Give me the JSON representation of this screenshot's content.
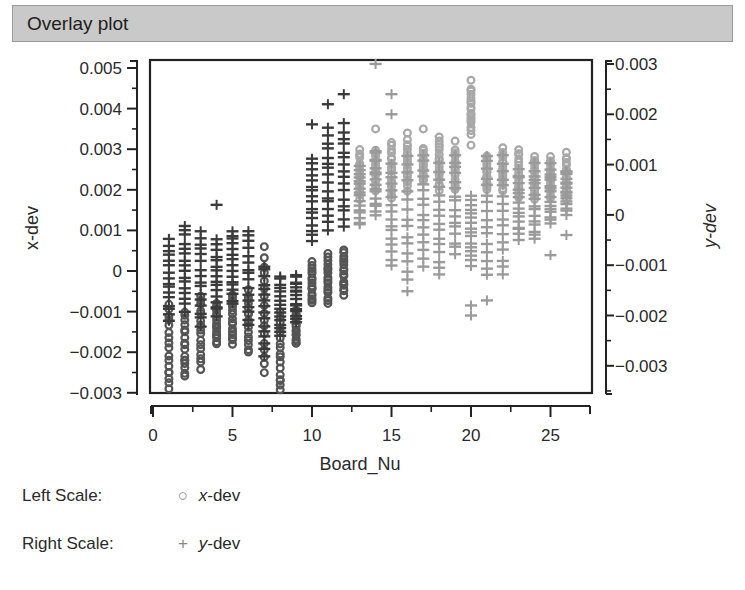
{
  "panel": {
    "title": "Overlay plot"
  },
  "legend": {
    "left": {
      "label": "Left Scale:",
      "symbol": "○",
      "series_prefix": "x",
      "series_suffix": "-dev"
    },
    "right": {
      "label": "Right Scale:",
      "symbol": "+",
      "series_prefix": "y",
      "series_suffix": "-dev"
    }
  },
  "colors": {
    "xdev_dark": "#555555",
    "xdev_light": "#a8a8a8",
    "ydev_dark": "#3a3a3a",
    "ydev_light": "#9a9a9a",
    "frame": "#222222"
  },
  "chart_data": {
    "type": "scatter",
    "title": "Overlay plot",
    "xlabel": "Board_Nu",
    "ylabel_left": "x-dev",
    "ylabel_right": "y-dev",
    "xlim": [
      0,
      27.5
    ],
    "ylim_left": [
      -0.003,
      0.005
    ],
    "ylim_right": [
      -0.0032,
      0.003
    ],
    "x_ticks": [
      0,
      5,
      10,
      15,
      20,
      25
    ],
    "y_ticks_left": [
      "0.005",
      "0.004",
      "0.003",
      "0.002",
      "0.001",
      "0",
      "−0.001",
      "−0.002",
      "−0.003"
    ],
    "y_tick_values_left": [
      0.005,
      0.004,
      0.003,
      0.002,
      0.001,
      0,
      -0.001,
      -0.002,
      -0.003
    ],
    "y_ticks_right": [
      "0.003",
      "0.002",
      "0.001",
      "0",
      "−0.001",
      "−0.002",
      "−0.003"
    ],
    "y_tick_values_right": [
      0.003,
      0.002,
      0.001,
      0,
      -0.001,
      -0.002,
      -0.003
    ],
    "grid": false,
    "legend_position": "bottom-left",
    "series": [
      {
        "name": "x-dev",
        "scale": "left",
        "marker": "circle",
        "columns": [
          {
            "x": 1,
            "min": -0.0029,
            "max": -0.0008,
            "outliers": [
              -0.0025
            ]
          },
          {
            "x": 2,
            "min": -0.0026,
            "max": -0.001,
            "outliers": [
              -0.0022
            ]
          },
          {
            "x": 3,
            "min": -0.0024,
            "max": -0.0006,
            "outliers": []
          },
          {
            "x": 4,
            "min": -0.0018,
            "max": -0.0008,
            "outliers": []
          },
          {
            "x": 5,
            "min": -0.0018,
            "max": -0.0006,
            "outliers": []
          },
          {
            "x": 6,
            "min": -0.002,
            "max": -0.0005,
            "outliers": []
          },
          {
            "x": 7,
            "min": -0.0025,
            "max": 0.0003,
            "outliers": [
              0.0006
            ]
          },
          {
            "x": 8,
            "min": -0.0029,
            "max": -0.001,
            "outliers": [
              -0.0027
            ]
          },
          {
            "x": 9,
            "min": -0.0018,
            "max": -0.001,
            "outliers": []
          },
          {
            "x": 10,
            "min": -0.0008,
            "max": 0.0002,
            "outliers": []
          },
          {
            "x": 11,
            "min": -0.0008,
            "max": 0.0004,
            "outliers": []
          },
          {
            "x": 12,
            "min": -0.0006,
            "max": 0.0005,
            "outliers": []
          },
          {
            "x": 13,
            "min": 0.0018,
            "max": 0.003,
            "outliers": []
          },
          {
            "x": 14,
            "min": 0.002,
            "max": 0.003,
            "outliers": [
              0.0035
            ]
          },
          {
            "x": 15,
            "min": 0.0018,
            "max": 0.0032,
            "outliers": []
          },
          {
            "x": 16,
            "min": 0.002,
            "max": 0.0032,
            "outliers": [
              0.0034
            ]
          },
          {
            "x": 17,
            "min": 0.0022,
            "max": 0.003,
            "outliers": [
              0.0035
            ]
          },
          {
            "x": 18,
            "min": 0.002,
            "max": 0.0032,
            "outliers": [
              0.0033
            ]
          },
          {
            "x": 19,
            "min": 0.002,
            "max": 0.003,
            "outliers": [
              0.0032
            ]
          },
          {
            "x": 20,
            "min": 0.0034,
            "max": 0.0045,
            "outliers": [
              0.0047,
              0.0031
            ]
          },
          {
            "x": 21,
            "min": 0.002,
            "max": 0.0028,
            "outliers": []
          },
          {
            "x": 22,
            "min": 0.002,
            "max": 0.003,
            "outliers": []
          },
          {
            "x": 23,
            "min": 0.0018,
            "max": 0.003,
            "outliers": []
          },
          {
            "x": 24,
            "min": 0.0018,
            "max": 0.0028,
            "outliers": []
          },
          {
            "x": 25,
            "min": 0.0018,
            "max": 0.0028,
            "outliers": []
          },
          {
            "x": 26,
            "min": 0.0018,
            "max": 0.0029,
            "outliers": []
          }
        ]
      },
      {
        "name": "y-dev",
        "scale": "right",
        "marker": "plus",
        "columns": [
          {
            "x": 1,
            "min": -0.0021,
            "max": -0.0005,
            "outliers": []
          },
          {
            "x": 2,
            "min": -0.0019,
            "max": -0.0002,
            "outliers": []
          },
          {
            "x": 3,
            "min": -0.0022,
            "max": -0.0003,
            "outliers": []
          },
          {
            "x": 4,
            "min": -0.002,
            "max": -0.0005,
            "outliers": [
              0.0002
            ]
          },
          {
            "x": 5,
            "min": -0.0018,
            "max": -0.0003,
            "outliers": []
          },
          {
            "x": 6,
            "min": -0.0022,
            "max": -0.0003,
            "outliers": []
          },
          {
            "x": 7,
            "min": -0.0028,
            "max": -0.001,
            "outliers": []
          },
          {
            "x": 8,
            "min": -0.0024,
            "max": -0.0012,
            "outliers": []
          },
          {
            "x": 9,
            "min": -0.0021,
            "max": -0.0012,
            "outliers": []
          },
          {
            "x": 10,
            "min": -0.0005,
            "max": 0.0011,
            "outliers": [
              0.0018
            ]
          },
          {
            "x": 11,
            "min": -0.0003,
            "max": 0.0017,
            "outliers": [
              0.0022
            ]
          },
          {
            "x": 12,
            "min": -0.0002,
            "max": 0.0018,
            "outliers": [
              0.0024
            ]
          },
          {
            "x": 13,
            "min": -0.0002,
            "max": 0.001,
            "outliers": []
          },
          {
            "x": 14,
            "min": 0.0,
            "max": 0.0013,
            "outliers": [
              0.003
            ]
          },
          {
            "x": 15,
            "min": -0.001,
            "max": 0.001,
            "outliers": [
              0.0024,
              0.002
            ]
          },
          {
            "x": 16,
            "min": -0.0015,
            "max": 0.0012,
            "outliers": []
          },
          {
            "x": 17,
            "min": -0.001,
            "max": 0.0012,
            "outliers": []
          },
          {
            "x": 18,
            "min": -0.0012,
            "max": 0.001,
            "outliers": []
          },
          {
            "x": 19,
            "min": -0.0008,
            "max": 0.0012,
            "outliers": []
          },
          {
            "x": 20,
            "min": -0.001,
            "max": 0.0004,
            "outliers": [
              -0.0018,
              -0.002
            ]
          },
          {
            "x": 21,
            "min": -0.0012,
            "max": 0.0012,
            "outliers": [
              -0.0017
            ]
          },
          {
            "x": 22,
            "min": -0.0012,
            "max": 0.0012,
            "outliers": []
          },
          {
            "x": 23,
            "min": -0.0005,
            "max": 0.0009,
            "outliers": []
          },
          {
            "x": 24,
            "min": -0.0005,
            "max": 0.001,
            "outliers": []
          },
          {
            "x": 25,
            "min": -0.0002,
            "max": 0.001,
            "outliers": [
              -0.0008
            ]
          },
          {
            "x": 26,
            "min": 0.0,
            "max": 0.0009,
            "outliers": [
              -0.0004
            ]
          }
        ]
      }
    ]
  }
}
